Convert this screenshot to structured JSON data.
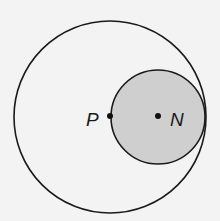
{
  "diagram": {
    "outer_circle": {
      "cx": 110,
      "cy": 117,
      "r": 96,
      "stroke": "#1a1a1a",
      "fill": "none"
    },
    "inner_circle": {
      "cx": 158,
      "cy": 117,
      "r": 47,
      "stroke": "#1a1a1a",
      "fill": "#cfcfcf"
    },
    "points": [
      {
        "name": "P",
        "label": "P",
        "x": 110,
        "y": 116
      },
      {
        "name": "N",
        "label": "N",
        "x": 158,
        "y": 116
      }
    ]
  }
}
